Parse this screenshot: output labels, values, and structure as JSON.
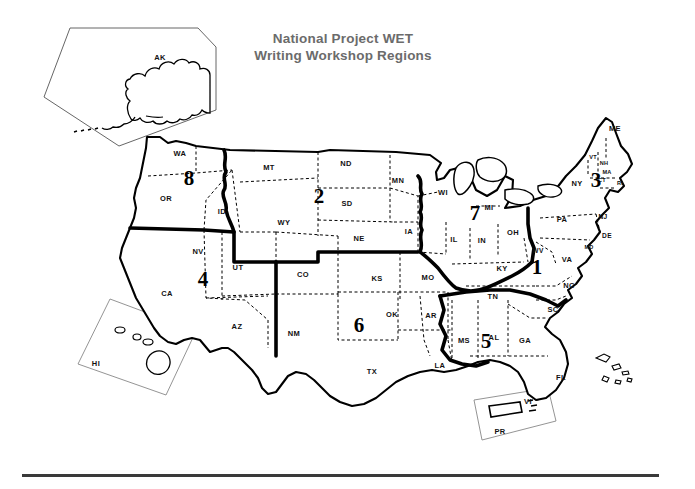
{
  "title": {
    "line1": "National Project WET",
    "line2": "Writing Workshop Regions",
    "color": "#6b6b6b"
  },
  "map": {
    "kind": "united-states-regions-map",
    "outline_color": "#000000",
    "state_border_style": "dashed",
    "region_border_style": "thick-solid",
    "background": "#ffffff"
  },
  "regions": [
    {
      "number": "1",
      "x": 537,
      "y": 267,
      "states": [
        "KY",
        "TN",
        "WV",
        "VA",
        "NC"
      ]
    },
    {
      "number": "2",
      "x": 319,
      "y": 196,
      "states": [
        "MT",
        "ND",
        "SD",
        "WY",
        "NE",
        "MN",
        "IA"
      ]
    },
    {
      "number": "3",
      "x": 596,
      "y": 180,
      "states": [
        "ME",
        "VT",
        "NH",
        "MA",
        "CT",
        "RI",
        "NY",
        "PA",
        "NJ",
        "DE",
        "MD"
      ]
    },
    {
      "number": "4",
      "x": 203,
      "y": 279,
      "states": [
        "CA",
        "NV",
        "UT",
        "AZ"
      ]
    },
    {
      "number": "5",
      "x": 486,
      "y": 341,
      "states": [
        "MS",
        "AL",
        "GA",
        "SC",
        "FL"
      ]
    },
    {
      "number": "6",
      "x": 359,
      "y": 325,
      "states": [
        "CO",
        "NM",
        "KS",
        "OK",
        "TX",
        "MO",
        "AR",
        "LA"
      ]
    },
    {
      "number": "7",
      "x": 475,
      "y": 213,
      "states": [
        "WI",
        "MI",
        "IL",
        "IN",
        "OH"
      ]
    },
    {
      "number": "8",
      "x": 189,
      "y": 178,
      "states": [
        "WA",
        "OR",
        "ID"
      ]
    }
  ],
  "state_labels": [
    {
      "text": "WA",
      "x": 180,
      "y": 153,
      "size": "normal"
    },
    {
      "text": "OR",
      "x": 166,
      "y": 198,
      "size": "normal"
    },
    {
      "text": "ID",
      "x": 222,
      "y": 211,
      "size": "normal"
    },
    {
      "text": "MT",
      "x": 269,
      "y": 167,
      "size": "normal"
    },
    {
      "text": "WY",
      "x": 284,
      "y": 222,
      "size": "normal"
    },
    {
      "text": "ND",
      "x": 346,
      "y": 163,
      "size": "normal"
    },
    {
      "text": "SD",
      "x": 347,
      "y": 203,
      "size": "normal"
    },
    {
      "text": "NE",
      "x": 359,
      "y": 238,
      "size": "normal"
    },
    {
      "text": "MN",
      "x": 398,
      "y": 180,
      "size": "normal"
    },
    {
      "text": "IA",
      "x": 409,
      "y": 231,
      "size": "normal"
    },
    {
      "text": "WI",
      "x": 443,
      "y": 192,
      "size": "normal"
    },
    {
      "text": "MI",
      "x": 489,
      "y": 207,
      "size": "normal"
    },
    {
      "text": "IL",
      "x": 454,
      "y": 239,
      "size": "normal"
    },
    {
      "text": "IN",
      "x": 482,
      "y": 240,
      "size": "normal"
    },
    {
      "text": "OH",
      "x": 513,
      "y": 232,
      "size": "normal"
    },
    {
      "text": "PA",
      "x": 562,
      "y": 219,
      "size": "normal"
    },
    {
      "text": "NY",
      "x": 577,
      "y": 183,
      "size": "normal"
    },
    {
      "text": "ME",
      "x": 615,
      "y": 128,
      "size": "normal"
    },
    {
      "text": "VT",
      "x": 593,
      "y": 157,
      "size": "tiny"
    },
    {
      "text": "NH",
      "x": 604,
      "y": 163,
      "size": "tiny"
    },
    {
      "text": "MA",
      "x": 607,
      "y": 172,
      "size": "tiny"
    },
    {
      "text": "CT",
      "x": 602,
      "y": 180,
      "size": "tiny"
    },
    {
      "text": "RI",
      "x": 620,
      "y": 183,
      "size": "tiny"
    },
    {
      "text": "NJ",
      "x": 603,
      "y": 216,
      "size": "sm"
    },
    {
      "text": "DE",
      "x": 607,
      "y": 235,
      "size": "sm"
    },
    {
      "text": "MD",
      "x": 589,
      "y": 247,
      "size": "tiny"
    },
    {
      "text": "WV",
      "x": 538,
      "y": 250,
      "size": "sm"
    },
    {
      "text": "VA",
      "x": 567,
      "y": 259,
      "size": "normal"
    },
    {
      "text": "NC",
      "x": 569,
      "y": 285,
      "size": "normal"
    },
    {
      "text": "KY",
      "x": 502,
      "y": 268,
      "size": "normal"
    },
    {
      "text": "TN",
      "x": 493,
      "y": 296,
      "size": "normal"
    },
    {
      "text": "SC",
      "x": 553,
      "y": 309,
      "size": "normal"
    },
    {
      "text": "GA",
      "x": 525,
      "y": 340,
      "size": "normal"
    },
    {
      "text": "AL",
      "x": 494,
      "y": 337,
      "size": "normal"
    },
    {
      "text": "MS",
      "x": 464,
      "y": 340,
      "size": "normal"
    },
    {
      "text": "LA",
      "x": 440,
      "y": 365,
      "size": "normal"
    },
    {
      "text": "FL",
      "x": 561,
      "y": 377,
      "size": "normal"
    },
    {
      "text": "AR",
      "x": 431,
      "y": 315,
      "size": "normal"
    },
    {
      "text": "MO",
      "x": 428,
      "y": 277,
      "size": "normal"
    },
    {
      "text": "KS",
      "x": 377,
      "y": 278,
      "size": "normal"
    },
    {
      "text": "OK",
      "x": 392,
      "y": 314,
      "size": "normal"
    },
    {
      "text": "TX",
      "x": 372,
      "y": 371,
      "size": "normal"
    },
    {
      "text": "NM",
      "x": 294,
      "y": 333,
      "size": "normal"
    },
    {
      "text": "CO",
      "x": 303,
      "y": 274,
      "size": "normal"
    },
    {
      "text": "UT",
      "x": 238,
      "y": 267,
      "size": "normal"
    },
    {
      "text": "AZ",
      "x": 237,
      "y": 326,
      "size": "normal"
    },
    {
      "text": "NV",
      "x": 198,
      "y": 251,
      "size": "normal"
    },
    {
      "text": "CA",
      "x": 167,
      "y": 293,
      "size": "normal"
    }
  ],
  "insets": [
    {
      "name": "alaska",
      "label": "AK",
      "label_x": 160,
      "label_y": 57
    },
    {
      "name": "hawaii",
      "label": "HI",
      "label_x": 96,
      "label_y": 363
    },
    {
      "name": "puerto-rico",
      "label": "PR",
      "label_x": 500,
      "label_y": 431
    },
    {
      "name": "virgin-islands",
      "label": "VI",
      "label_x": 528,
      "label_y": 401
    }
  ],
  "footer": {
    "rule": true
  }
}
